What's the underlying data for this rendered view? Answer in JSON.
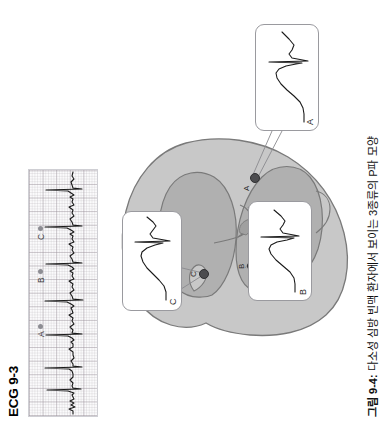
{
  "page": {
    "background_color": "#ffffff",
    "rotation_note": "page content rendered rotated 90 degrees counter-clockwise"
  },
  "ecg_panel": {
    "title": "ECG 9-3",
    "strip": {
      "grid_major_color": "#968c96",
      "grid_minor_color": "#a8a0a8",
      "trace_color": "#1a1a1a",
      "border_color": "#cfcfd4"
    },
    "beat_markers": [
      {
        "label": "A",
        "dot_color": "#8d8d93"
      },
      {
        "label": "B",
        "dot_color": "#8d8d93"
      },
      {
        "label": "C",
        "dot_color": "#8d8d93"
      }
    ]
  },
  "diagram": {
    "heart": {
      "outer_fill": "#c8c8c8",
      "inner_fill": "#b0b0b0",
      "stroke": "#7a7a7a"
    },
    "site_markers": [
      {
        "label": "A",
        "dot_color": "#4c4c4f"
      },
      {
        "label": "B",
        "dot_color": "#4c4c4f"
      },
      {
        "label": "C",
        "dot_color": "#4c4c4f"
      }
    ],
    "callouts": [
      {
        "label": "A",
        "border_color": "#9a9a9f",
        "wave_color": "#1a1a1a"
      },
      {
        "label": "B",
        "border_color": "#9a9a9f",
        "wave_color": "#1a1a1a"
      },
      {
        "label": "C",
        "border_color": "#9a9a9f",
        "wave_color": "#1a1a1a"
      }
    ]
  },
  "caption": {
    "figure_number": "그림 9-4:",
    "text": " 다소성 심방 빈맥 환자에서 보이는 3종류의 P파 모양"
  }
}
